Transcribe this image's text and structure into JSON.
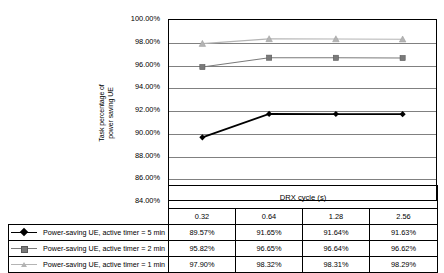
{
  "chart_data": {
    "type": "line",
    "title": "",
    "xlabel": "DRX cycle (s)",
    "ylabel": "Task percentage of power saving UE",
    "ylabel_line1": "Task percentage of",
    "ylabel_line2": "power saving UE",
    "categories": [
      "0.32",
      "0.64",
      "1.28",
      "2.56"
    ],
    "ylim": [
      84,
      100
    ],
    "ytick_labels": [
      "100.00%",
      "98.00%",
      "96.00%",
      "94.00%",
      "92.00%",
      "90.00%",
      "88.00%",
      "86.00%",
      "84.00%"
    ],
    "ytick_values": [
      100,
      98,
      96,
      94,
      92,
      90,
      88,
      86,
      84
    ],
    "grid": true,
    "legend_position": "bottom-left-table",
    "series": [
      {
        "name": "Power-saving UE, active timer = 5 min",
        "marker": "diamond",
        "color": "#000000",
        "values": [
          89.57,
          91.65,
          91.64,
          91.63
        ],
        "labels": [
          "89.57%",
          "91.65%",
          "91.64%",
          "91.63%"
        ]
      },
      {
        "name": "Power-saving UE, active timer = 2 min",
        "marker": "square",
        "color": "#7a7a7a",
        "values": [
          95.82,
          96.65,
          96.64,
          96.62
        ],
        "labels": [
          "95.82%",
          "96.65%",
          "96.64%",
          "96.62%"
        ]
      },
      {
        "name": "Power-saving UE, active timer = 1 min",
        "marker": "triangle",
        "color": "#b4b4b4",
        "values": [
          97.9,
          98.32,
          98.31,
          98.29
        ],
        "labels": [
          "97.90%",
          "98.32%",
          "98.31%",
          "98.29%"
        ]
      }
    ]
  },
  "table": {
    "xaxis_title": "DRX cycle (s)",
    "column_headers": [
      "0.32",
      "0.64",
      "1.28",
      "2.56"
    ],
    "rows": [
      {
        "legend": "Power-saving UE, active timer = 5 min",
        "marker": "diamond",
        "cells": [
          "89.57%",
          "91.65%",
          "91.64%",
          "91.63%"
        ]
      },
      {
        "legend": "Power-saving UE, active timer = 2 min",
        "marker": "square",
        "cells": [
          "95.82%",
          "96.65%",
          "96.64%",
          "96.62%"
        ]
      },
      {
        "legend": "Power-saving UE, active timer = 1 min",
        "marker": "triangle",
        "cells": [
          "97.90%",
          "98.32%",
          "98.31%",
          "98.29%"
        ]
      }
    ]
  },
  "colors": {
    "series_5min": "#000000",
    "series_2min": "#7a7a7a",
    "series_1min": "#b4b4b4",
    "gridline": "#808080",
    "axis": "#000000",
    "background": "#ffffff"
  }
}
